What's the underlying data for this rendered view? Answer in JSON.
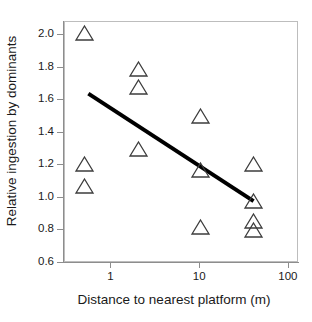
{
  "chart_data": {
    "type": "scatter",
    "title": "",
    "xlabel": "Distance to nearest platform (m)",
    "ylabel": "Relative ingestion by dominants",
    "x_scale": "log",
    "xlim": [
      0.3,
      130
    ],
    "ylim": [
      0.6,
      2.08
    ],
    "grid": false,
    "legend": null,
    "xticks": [
      1,
      10,
      100
    ],
    "xtick_labels": [
      "1",
      "10",
      "100"
    ],
    "yticks": [
      0.6,
      0.8,
      1.0,
      1.2,
      1.4,
      1.6,
      1.8,
      2.0
    ],
    "ytick_labels": [
      "0.6",
      "0.8",
      "1.0",
      "1.2",
      "1.4",
      "1.6",
      "1.8",
      "2.0"
    ],
    "marker": "open-triangle-up",
    "marker_color": "#3c3c3c",
    "points": [
      {
        "x": 0.5,
        "y": 2.01
      },
      {
        "x": 0.5,
        "y": 1.21
      },
      {
        "x": 0.5,
        "y": 1.07
      },
      {
        "x": 2.0,
        "y": 1.79
      },
      {
        "x": 2.0,
        "y": 1.68
      },
      {
        "x": 2.0,
        "y": 1.3
      },
      {
        "x": 10.0,
        "y": 1.5
      },
      {
        "x": 10.0,
        "y": 1.17
      },
      {
        "x": 10.0,
        "y": 0.82
      },
      {
        "x": 40.0,
        "y": 1.21
      },
      {
        "x": 40.0,
        "y": 0.98
      },
      {
        "x": 40.0,
        "y": 0.86
      },
      {
        "x": 40.0,
        "y": 0.8
      }
    ],
    "trendline": {
      "type": "linear-on-log-x",
      "color": "#000000",
      "width_px": 4,
      "x_start": 0.55,
      "y_start": 1.64,
      "x_end": 40.0,
      "y_end": 0.98
    }
  },
  "axes": {
    "y_axis_title": "Relative ingestion by dominants",
    "x_axis_title": "Distance to nearest platform (m)"
  },
  "colors": {
    "background": "#ffffff",
    "frame": "#bdbdbd",
    "spine": "#8d8d8d",
    "text": "#1a1a1a",
    "marker_stroke": "#3c3c3c",
    "trendline": "#000000"
  }
}
